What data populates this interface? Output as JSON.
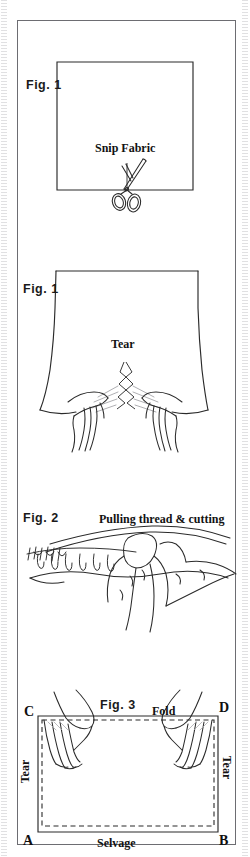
{
  "document": {
    "title": "Fabric Preparation — Figures 1–3",
    "page_background": "#ffffff",
    "ink_color": "#1a1a1a",
    "border_color": "#6d6d72"
  },
  "figures": [
    {
      "id": "fig1-snip",
      "tag": "Fig. 1",
      "caption": "Snip Fabric",
      "icon": "scissors-icon",
      "description": "Rectangle of fabric with scissors snipping the bottom edge"
    },
    {
      "id": "fig1-tear",
      "tag": "Fig. 1",
      "caption": "Tear",
      "icon": "two-hands-tearing-icon",
      "description": "Two hands tearing fabric apart along the snip"
    },
    {
      "id": "fig2-pulling",
      "tag": "Fig. 2",
      "caption": "Pulling thread & cutting",
      "icon": "hand-pulling-thread-icon",
      "description": "Hand pulling a thread from the fabric edge while cutting along it"
    },
    {
      "id": "fig3-fold",
      "tag": "Fig. 3",
      "caption": "Fold",
      "icon": "two-hands-holding-fold-icon",
      "description": "Folded fabric held at two top corners, with tear edges at the sides and selvage at the bottom"
    }
  ],
  "fig3_labels": {
    "corner_top_left": "C",
    "corner_top_right": "D",
    "corner_bottom_left": "A",
    "corner_bottom_right": "B",
    "top_edge": "Fold",
    "left_edge": "Tear",
    "right_edge": "Tear",
    "bottom_edge": "Selvage"
  }
}
